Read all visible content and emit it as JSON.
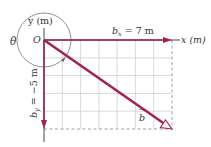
{
  "axes": {
    "x_label": "x (m)",
    "y_label": "y (m)",
    "origin_label": "O"
  },
  "angle": {
    "symbol": "θ"
  },
  "vectors": {
    "bx": {
      "symbol": "b",
      "subscript": "x",
      "value_text": "= 7 m",
      "dx": 7
    },
    "by": {
      "symbol": "b",
      "subscript": "y",
      "value_text": "= −5 m",
      "dy": -5
    },
    "b": {
      "symbol": "b",
      "arrow": "→"
    }
  },
  "grid": {
    "columns": 7,
    "rows": 5
  },
  "colors": {
    "vector": "#a3234e",
    "axis": "#333333",
    "grid": "#cfcfcf",
    "dashed": "#888888",
    "circle": "#666666"
  }
}
